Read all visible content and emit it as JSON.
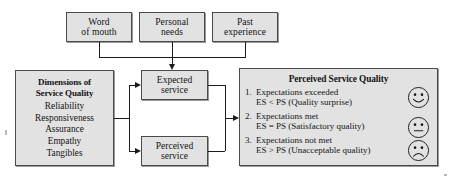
{
  "diagram": {
    "type": "flow-diagram",
    "background_color": "#ffffff",
    "box_fill_color": "#e2e2e2",
    "box_border_color": "#4a4a4a",
    "connector_color": "#1b1b1b"
  },
  "sources": [
    {
      "line1": "Word",
      "line2": "of mouth"
    },
    {
      "line1": "Personal",
      "line2": "needs"
    },
    {
      "line1": "Past",
      "line2": "experience"
    }
  ],
  "dimensions": {
    "heading_line1": "Dimensions of",
    "heading_line2": "Service Quality",
    "items": [
      "Reliability",
      "Responsiveness",
      "Assurance",
      "Empathy",
      "Tangibles"
    ]
  },
  "services": [
    {
      "line1": "Expected",
      "line2": "service"
    },
    {
      "line1": "Perceived",
      "line2": "service"
    }
  ],
  "outcome": {
    "title": "Perceived Service Quality",
    "rows": [
      {
        "number": "1.",
        "line1": "Expectations exceeded",
        "line2": "ES < PS (Quality surprise)",
        "face": "smiling-face"
      },
      {
        "number": "2.",
        "line1": "Expectations met",
        "line2": "ES = PS (Satisfactory quality)",
        "face": "neutral-face"
      },
      {
        "number": "3.",
        "line1": "Expectations not met",
        "line2": "ES > PS (Unacceptable quality)",
        "face": "frowning-face"
      }
    ]
  }
}
